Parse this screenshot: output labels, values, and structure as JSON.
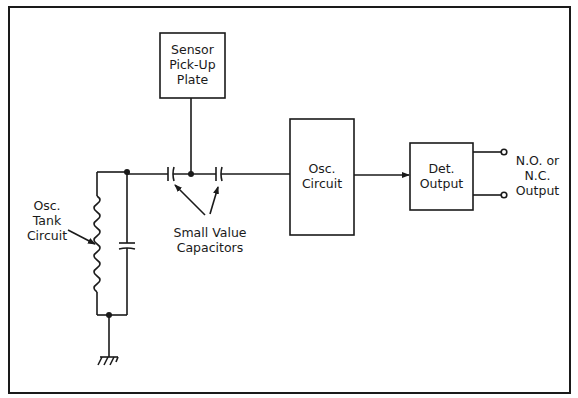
{
  "diagram": {
    "type": "proximity sensor block diagram",
    "colors": {
      "stroke": "#1a1a1a",
      "background": "#ffffff"
    },
    "blocks": {
      "sensor_plate": {
        "line1": "Sensor",
        "line2": "Pick-Up",
        "line3": "Plate"
      },
      "osc_circuit": {
        "line1": "Osc.",
        "line2": "Circuit"
      },
      "det_output": {
        "line1": "Det.",
        "line2": "Output"
      }
    },
    "labels": {
      "tank": {
        "line1": "Osc.",
        "line2": "Tank",
        "line3": "Circuit"
      },
      "capacitors": {
        "line1": "Small Value",
        "line2": "Capacitors"
      },
      "output": {
        "line1": "N.O. or",
        "line2": "N.C.",
        "line3": "Output"
      }
    },
    "components": [
      "inductor",
      "tank-capacitor",
      "coupling-capacitor-1",
      "coupling-capacitor-2",
      "ground",
      "output-terminal-no",
      "output-terminal-nc"
    ]
  }
}
